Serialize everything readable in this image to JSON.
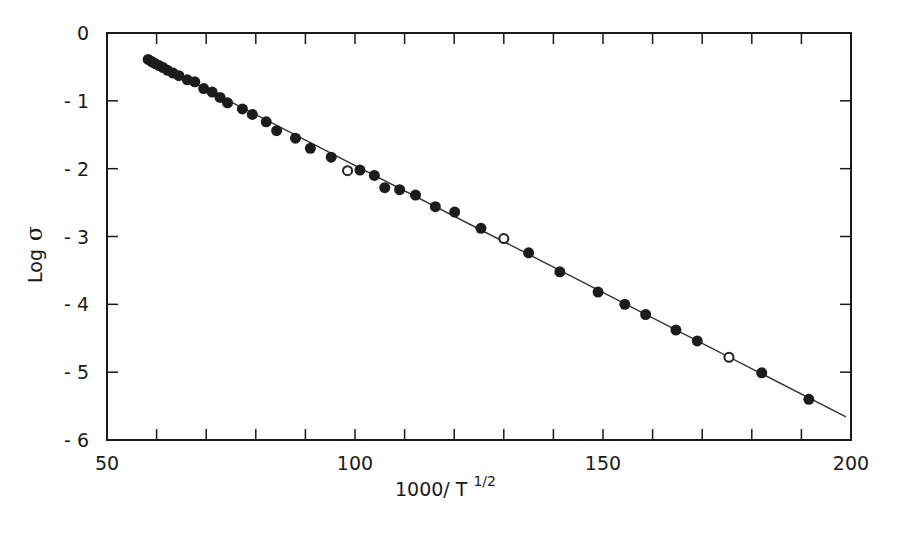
{
  "chart_data": {
    "type": "scatter",
    "title": "",
    "xlabel": "1000/T^(1/2)",
    "xlabel_main": "1000/ T",
    "xlabel_sup": "1/2",
    "ylabel": "Log σ",
    "ylabel_main": "Log",
    "ylabel_symbol": "σ",
    "xlim": [
      50,
      200
    ],
    "ylim": [
      -6,
      0
    ],
    "x_ticks": [
      50,
      100,
      150,
      200
    ],
    "x_tick_labels": [
      "50",
      "100",
      "150",
      "200"
    ],
    "x_minor_step": 10,
    "y_ticks": [
      0,
      -1,
      -2,
      -3,
      -4,
      -5,
      -6
    ],
    "y_tick_labels": [
      "0",
      "- 1",
      "- 2",
      "- 3",
      "- 4",
      "- 5",
      "- 6"
    ],
    "grid": false,
    "legend": null,
    "fit_line": {
      "x": [
        58.0,
        199.0
      ],
      "y": [
        -0.38,
        -5.66
      ]
    },
    "series": [
      {
        "name": "filled",
        "marker": "filled-circle",
        "points": [
          [
            58.3,
            -0.39
          ],
          [
            59.0,
            -0.42
          ],
          [
            59.7,
            -0.45
          ],
          [
            60.5,
            -0.48
          ],
          [
            61.3,
            -0.51
          ],
          [
            62.2,
            -0.55
          ],
          [
            63.3,
            -0.59
          ],
          [
            64.5,
            -0.63
          ],
          [
            66.2,
            -0.69
          ],
          [
            67.7,
            -0.72
          ],
          [
            69.5,
            -0.82
          ],
          [
            71.2,
            -0.87
          ],
          [
            72.8,
            -0.95
          ],
          [
            74.3,
            -1.03
          ],
          [
            77.3,
            -1.12
          ],
          [
            79.3,
            -1.2
          ],
          [
            82.1,
            -1.31
          ],
          [
            84.2,
            -1.44
          ],
          [
            88.0,
            -1.55
          ],
          [
            91.0,
            -1.7
          ],
          [
            95.2,
            -1.83
          ],
          [
            101.0,
            -2.02
          ],
          [
            103.9,
            -2.1
          ],
          [
            106.0,
            -2.28
          ],
          [
            109.0,
            -2.31
          ],
          [
            112.2,
            -2.39
          ],
          [
            116.2,
            -2.56
          ],
          [
            120.1,
            -2.64
          ],
          [
            125.4,
            -2.88
          ],
          [
            135.0,
            -3.24
          ],
          [
            141.3,
            -3.52
          ],
          [
            149.0,
            -3.82
          ],
          [
            154.4,
            -4.0
          ],
          [
            158.6,
            -4.15
          ],
          [
            164.7,
            -4.38
          ],
          [
            169.0,
            -4.54
          ],
          [
            182.0,
            -5.01
          ],
          [
            191.5,
            -5.4
          ]
        ]
      },
      {
        "name": "open",
        "marker": "open-circle",
        "points": [
          [
            98.5,
            -2.03
          ],
          [
            130.0,
            -3.03
          ],
          [
            175.4,
            -4.78
          ]
        ]
      }
    ]
  }
}
